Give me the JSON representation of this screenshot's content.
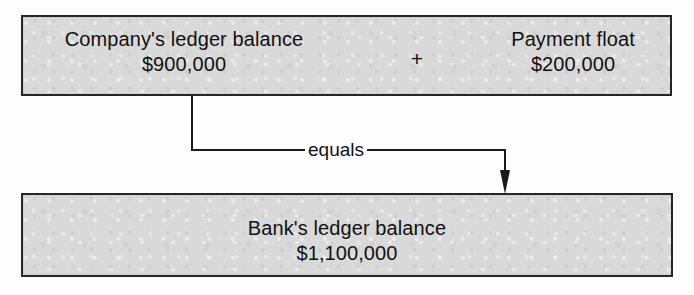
{
  "diagram": {
    "background_color": "#fdfdfd",
    "box_fill_color": "#d9d9d9",
    "box_border_color": "#262626",
    "text_color": "#111111",
    "top_box": {
      "left_item": {
        "label": "Company's ledger balance",
        "amount": "$900,000"
      },
      "operator": "+",
      "right_item": {
        "label": "Payment float",
        "amount": "$200,000"
      }
    },
    "connector": {
      "label": "equals",
      "arrow_direction": "down"
    },
    "bottom_box": {
      "label": "Bank's ledger balance",
      "amount": "$1,100,000"
    }
  }
}
